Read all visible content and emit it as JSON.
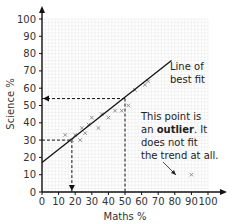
{
  "chart_data": {
    "type": "scatter",
    "title": "",
    "xlabel": "Maths %",
    "ylabel": "Science %",
    "xlim": [
      0,
      100
    ],
    "ylim": [
      0,
      100
    ],
    "grid": true,
    "x_ticks": [
      0,
      10,
      20,
      30,
      40,
      50,
      60,
      70,
      80,
      90,
      100
    ],
    "y_ticks": [
      0,
      10,
      20,
      30,
      40,
      50,
      60,
      70,
      80,
      90,
      100
    ],
    "series": [
      {
        "name": "Students",
        "points": [
          [
            14,
            33
          ],
          [
            18,
            30
          ],
          [
            20,
            33
          ],
          [
            23,
            30
          ],
          [
            24,
            37
          ],
          [
            26,
            34
          ],
          [
            28,
            39
          ],
          [
            30,
            43
          ],
          [
            34,
            37
          ],
          [
            36,
            45
          ],
          [
            40,
            43
          ],
          [
            44,
            47
          ],
          [
            48,
            47
          ],
          [
            52,
            50
          ],
          [
            56,
            59
          ],
          [
            62,
            62
          ],
          [
            64,
            64
          ]
        ]
      },
      {
        "name": "Outlier",
        "points": [
          [
            90,
            10
          ]
        ]
      }
    ],
    "line_of_best_fit": {
      "x0": 0,
      "y0": 17,
      "x1": 78,
      "y1": 76
    },
    "reading_lines": [
      {
        "x": 18,
        "y": 30
      },
      {
        "x": 50,
        "y": 54
      }
    ],
    "annotations": [
      {
        "text": "Line of best fit",
        "lines": [
          "Line of",
          "best fit"
        ]
      },
      {
        "text": "This point is an outlier. It does not fit the trend at all."
      }
    ]
  },
  "labels": {
    "xlabel": "Maths %",
    "ylabel": "Science %",
    "lobf_line1": "Line of",
    "lobf_line2": "best fit",
    "outlier_line1": "This point is",
    "outlier_line2_pre": "an ",
    "outlier_line2_bold": "outlier",
    "outlier_line2_post": ". It",
    "outlier_line3": "does not fit",
    "outlier_line4": "the trend at all."
  },
  "colors": {
    "axis": "#111111",
    "grid": "#e6e6e6",
    "point": "#888888",
    "line": "#111111"
  }
}
